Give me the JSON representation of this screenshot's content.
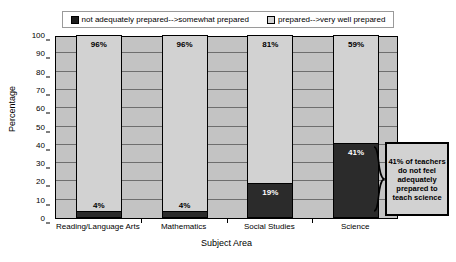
{
  "chart_data": {
    "type": "bar",
    "stacked": true,
    "title": "",
    "xlabel": "Subject Area",
    "ylabel": "Percentage",
    "ylim": [
      0,
      100
    ],
    "ytick_step": 10,
    "yticks": [
      "100",
      "90",
      "80",
      "70",
      "60",
      "50",
      "40",
      "30",
      "20",
      "10",
      "0"
    ],
    "grid": true,
    "legend_position": "top",
    "categories": [
      "Reading/Language Arts",
      "Mathematics",
      "Social Studies",
      "Science"
    ],
    "series": [
      {
        "name": "prepared-->very well prepared",
        "color": "#d2d2d2",
        "values": [
          96,
          96,
          81,
          59
        ],
        "labels": [
          "96%",
          "96%",
          "81%",
          "59%"
        ]
      },
      {
        "name": "not adequately prepared-->somewhat prepared",
        "color": "#2b2b2b",
        "values": [
          4,
          4,
          19,
          41
        ],
        "labels": [
          "4%",
          "4%",
          "19%",
          "41%"
        ]
      }
    ],
    "annotations": [
      {
        "text": "41% of teachers do not feel adequately prepared to teach science",
        "target_category": "Science",
        "target_series": "not adequately prepared-->somewhat prepared"
      }
    ]
  },
  "legend": {
    "entries": [
      {
        "label": "not adequately prepared-->somewhat prepared",
        "swatch": "dark"
      },
      {
        "label": "prepared-->very well prepared",
        "swatch": "light"
      }
    ]
  },
  "axes": {
    "y_title": "Percentage",
    "x_title": "Subject Area"
  },
  "callout": {
    "text": "41% of teachers do not feel adequately prepared to teach science"
  },
  "icons": {
    "brace": "curly-brace-icon"
  }
}
